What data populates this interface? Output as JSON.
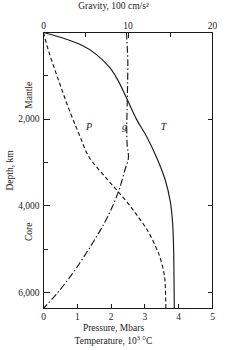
{
  "chart_data": {
    "type": "line",
    "title": "",
    "top_axis": {
      "label": "Gravity, 100 cm/s²",
      "ticks_major": [
        0,
        10,
        20
      ],
      "ticks_minor": [
        5,
        15
      ],
      "range": [
        0,
        20
      ]
    },
    "bottom_axis": {
      "label_line1": "Pressure, Mbars",
      "label_line2_prefix": "Temperature, 10",
      "label_line2_exponent": "3",
      "label_line2_suffix": " °C",
      "ticks_major": [
        0,
        1,
        2,
        3,
        4,
        5
      ],
      "range": [
        0,
        5
      ]
    },
    "y_axis": {
      "label": "Depth, km",
      "ticks_major": [
        "2,000",
        "4,000",
        "6,000"
      ],
      "ticks_major_values": [
        2000,
        4000,
        6000
      ],
      "ticks_minor_values": [
        1000,
        3000,
        5000
      ],
      "range": [
        0,
        6371
      ],
      "region_labels": [
        "Mantle",
        "Core"
      ]
    },
    "grid": false,
    "legend_position": "inline-curve-labels",
    "series": [
      {
        "name": "P",
        "label": "P",
        "axis": "bottom",
        "unit": "Mbars",
        "style": "dashed",
        "color": "#1a1a1a",
        "label_x": 1.35,
        "label_depth": 2250,
        "points": [
          {
            "depth": 0,
            "value": 0.0
          },
          {
            "depth": 400,
            "value": 0.14
          },
          {
            "depth": 800,
            "value": 0.31
          },
          {
            "depth": 1200,
            "value": 0.49
          },
          {
            "depth": 1600,
            "value": 0.67
          },
          {
            "depth": 2000,
            "value": 0.87
          },
          {
            "depth": 2400,
            "value": 1.08
          },
          {
            "depth": 2890,
            "value": 1.36
          },
          {
            "depth": 3400,
            "value": 1.9
          },
          {
            "depth": 3800,
            "value": 2.35
          },
          {
            "depth": 4200,
            "value": 2.75
          },
          {
            "depth": 4600,
            "value": 3.1
          },
          {
            "depth": 5000,
            "value": 3.35
          },
          {
            "depth": 5200,
            "value": 3.45
          },
          {
            "depth": 5500,
            "value": 3.55
          },
          {
            "depth": 5800,
            "value": 3.6
          },
          {
            "depth": 6371,
            "value": 3.62
          }
        ]
      },
      {
        "name": "g",
        "label": "g",
        "axis": "top",
        "unit": "100 cm/s²",
        "style": "dash-dot",
        "color": "#1a1a1a",
        "label_x": 9.6,
        "label_depth": 2250,
        "points": [
          {
            "depth": 0,
            "value": 9.82
          },
          {
            "depth": 300,
            "value": 9.9
          },
          {
            "depth": 700,
            "value": 9.98
          },
          {
            "depth": 1200,
            "value": 9.95
          },
          {
            "depth": 1700,
            "value": 9.9
          },
          {
            "depth": 2200,
            "value": 9.85
          },
          {
            "depth": 2600,
            "value": 9.9
          },
          {
            "depth": 2890,
            "value": 10.05
          },
          {
            "depth": 3200,
            "value": 9.6
          },
          {
            "depth": 3600,
            "value": 9.0
          },
          {
            "depth": 4000,
            "value": 8.2
          },
          {
            "depth": 4400,
            "value": 7.2
          },
          {
            "depth": 4800,
            "value": 6.0
          },
          {
            "depth": 5200,
            "value": 4.7
          },
          {
            "depth": 5600,
            "value": 3.3
          },
          {
            "depth": 6000,
            "value": 1.7
          },
          {
            "depth": 6371,
            "value": 0.0
          }
        ]
      },
      {
        "name": "T",
        "label": "T",
        "axis": "bottom",
        "unit": "10^3 °C",
        "style": "solid",
        "color": "#1a1a1a",
        "label_x": 3.55,
        "label_depth": 2250,
        "points": [
          {
            "depth": 0,
            "value": 0.0
          },
          {
            "depth": 120,
            "value": 0.55
          },
          {
            "depth": 300,
            "value": 1.15
          },
          {
            "depth": 500,
            "value": 1.55
          },
          {
            "depth": 800,
            "value": 1.95
          },
          {
            "depth": 1100,
            "value": 2.2
          },
          {
            "depth": 1500,
            "value": 2.45
          },
          {
            "depth": 2000,
            "value": 2.75
          },
          {
            "depth": 2400,
            "value": 3.05
          },
          {
            "depth": 2890,
            "value": 3.35
          },
          {
            "depth": 3400,
            "value": 3.6
          },
          {
            "depth": 3900,
            "value": 3.75
          },
          {
            "depth": 4400,
            "value": 3.82
          },
          {
            "depth": 5000,
            "value": 3.85
          },
          {
            "depth": 5600,
            "value": 3.86
          },
          {
            "depth": 6371,
            "value": 3.87
          }
        ]
      }
    ]
  }
}
